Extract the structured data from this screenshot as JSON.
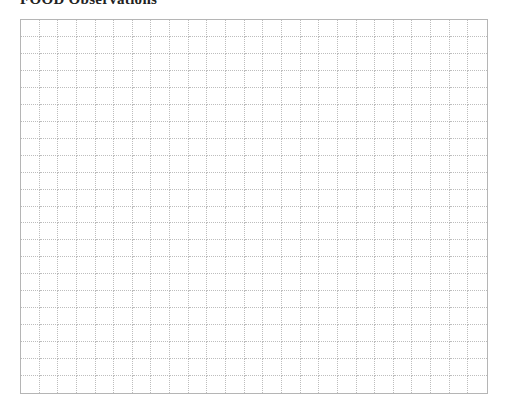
{
  "page": {
    "title": "FOOD Observations"
  },
  "grid": {
    "columns": 25,
    "rows": 22,
    "line_color": "#bdbdbd",
    "border_color": "#b5b5b5"
  }
}
